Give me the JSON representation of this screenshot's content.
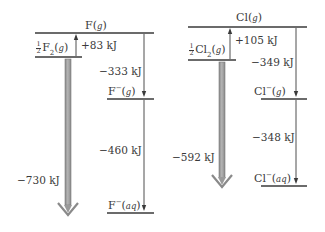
{
  "diagram": {
    "type": "energy-level diagram (Born-Haber style)",
    "panels": [
      {
        "element": "F",
        "levels": {
          "top": {
            "species": "F",
            "state": "g"
          },
          "standard": {
            "coefficient": "1/2",
            "species": "F",
            "subscript": "2",
            "state": "g"
          },
          "gas_ion": {
            "species": "F",
            "charge": "−",
            "state": "g"
          },
          "aq_ion": {
            "species": "F",
            "charge": "−",
            "state": "aq"
          }
        },
        "steps": {
          "atomization": "+83 kJ",
          "electron_affinity": "−333 kJ",
          "hydration": "−460 kJ",
          "overall": "−730 kJ"
        }
      },
      {
        "element": "Cl",
        "levels": {
          "top": {
            "species": "Cl",
            "state": "g"
          },
          "standard": {
            "coefficient": "1/2",
            "species": "Cl",
            "subscript": "2",
            "state": "g"
          },
          "gas_ion": {
            "species": "Cl",
            "charge": "−",
            "state": "g"
          },
          "aq_ion": {
            "species": "Cl",
            "charge": "−",
            "state": "aq"
          }
        },
        "steps": {
          "atomization": "+105 kJ",
          "electron_affinity": "−349 kJ",
          "hydration": "−348 kJ",
          "overall": "−592 kJ"
        }
      }
    ],
    "colors": {
      "line": "#3a3a3a",
      "big_arrow_fill": "#9a9a9a",
      "big_arrow_edge": "#7a7a7a"
    }
  },
  "frac": {
    "num": "1",
    "den": "2"
  }
}
